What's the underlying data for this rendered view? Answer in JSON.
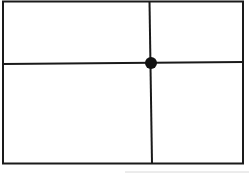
{
  "diagram": {
    "type": "grid-division",
    "frame": {
      "x": 3,
      "y": 1,
      "width": 240,
      "height": 162
    },
    "vertical_line_x": 151,
    "horizontal_line_y": 63,
    "intersection_dot": {
      "cx": 151,
      "cy": 63,
      "r": 6
    },
    "stroke_color": "#1a1a1a",
    "background_color": "#ffffff"
  }
}
